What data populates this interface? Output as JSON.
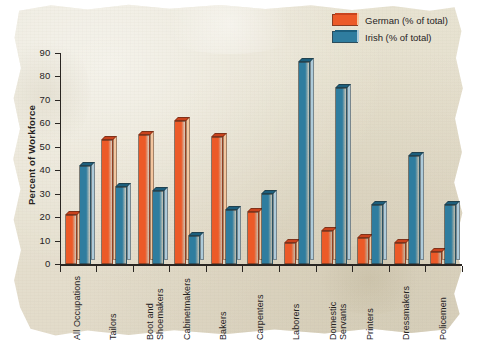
{
  "colors": {
    "paper": "#e7e2d1",
    "german_front": "#ec5a28",
    "german_side": "#f4c69f",
    "german_top": "#c9431d",
    "irish_front": "#2f7d9f",
    "irish_side": "#aecbda",
    "irish_top": "#1d5f7d",
    "axis": "#2a2622",
    "text": "#26231f"
  },
  "chart_data": {
    "type": "bar",
    "title": "",
    "xlabel": "",
    "ylabel": "Percent of Workforce",
    "ylim": [
      0,
      90
    ],
    "yticks": [
      0,
      10,
      20,
      30,
      40,
      50,
      60,
      70,
      80,
      90
    ],
    "grid": false,
    "legend_position": "top-right",
    "categories": [
      "All Occupations",
      "Boot and\nShoemakers",
      "Tailors",
      "Cabinetmakers",
      "Bakers",
      "Carpenters",
      "Laborers",
      "Domestic\nServants",
      "Printers",
      "Dressmakers",
      "Policemen"
    ],
    "category_labels": [
      [
        "All Occupations"
      ],
      [
        "Tailors"
      ],
      [
        "Boot and",
        "Shoemakers"
      ],
      [
        "Cabinetmakers"
      ],
      [
        "Bakers"
      ],
      [
        "Carpenters"
      ],
      [
        "Laborers"
      ],
      [
        "Domestic",
        "Servants"
      ],
      [
        "Printers"
      ],
      [
        "Dressmakers"
      ],
      [
        "Policemen"
      ]
    ],
    "series": [
      {
        "name": "German (% of total)",
        "color": "#ec5a28",
        "values": [
          21,
          53,
          55,
          61,
          54,
          22,
          9,
          14,
          11,
          9,
          5
        ]
      },
      {
        "name": "Irish (% of total)",
        "color": "#2f7d9f",
        "values": [
          42,
          33,
          31,
          12,
          23,
          30,
          86,
          75,
          25,
          46,
          25
        ]
      }
    ]
  },
  "legend": {
    "entries": [
      {
        "label": "German (% of total)"
      },
      {
        "label": "Irish (% of total)"
      }
    ]
  }
}
